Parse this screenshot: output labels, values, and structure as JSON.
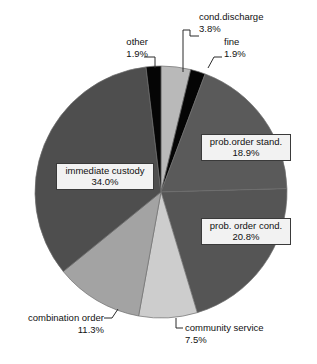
{
  "chart_data": {
    "type": "pie",
    "title": "",
    "subtitle": "",
    "xlabel": "",
    "ylabel": "",
    "legend_position": "none",
    "grid": false,
    "units": "percent",
    "start_angle_deg": 0,
    "direction": "clockwise",
    "categories": [
      "cond.discharge",
      "fine",
      "prob.order stand.",
      "prob. order cond.",
      "community service",
      "combination order",
      "immediate custody",
      "other"
    ],
    "values": [
      3.8,
      1.9,
      18.9,
      20.8,
      7.5,
      11.3,
      34.0,
      1.9
    ],
    "colors": [
      "#b9b9b9",
      "#050505",
      "#5a5a5a",
      "#555555",
      "#cdcdcd",
      "#a3a3a3",
      "#4e4e4e",
      "#050505"
    ],
    "slices": [
      {
        "label": "cond.discharge",
        "value": 3.8,
        "value_text": "3.8%",
        "color": "#b9b9b9",
        "label_style": "callout"
      },
      {
        "label": "fine",
        "value": 1.9,
        "value_text": "1.9%",
        "color": "#050505",
        "label_style": "callout"
      },
      {
        "label": "prob.order stand.",
        "value": 18.9,
        "value_text": "18.9%",
        "color": "#5a5a5a",
        "label_style": "boxed"
      },
      {
        "label": "prob. order cond.",
        "value": 20.8,
        "value_text": "20.8%",
        "color": "#555555",
        "label_style": "boxed"
      },
      {
        "label": "community service",
        "value": 7.5,
        "value_text": "7.5%",
        "color": "#cdcdcd",
        "label_style": "callout"
      },
      {
        "label": "combination order",
        "value": 11.3,
        "value_text": "11.3%",
        "color": "#a3a3a3",
        "label_style": "callout"
      },
      {
        "label": "immediate custody",
        "value": 34.0,
        "value_text": "34.0%",
        "color": "#4e4e4e",
        "label_style": "boxed"
      },
      {
        "label": "other",
        "value": 1.9,
        "value_text": "1.9%",
        "color": "#050505",
        "label_style": "callout"
      }
    ]
  },
  "labels": {
    "cond_discharge": {
      "name": "cond.discharge",
      "pct": "3.8%"
    },
    "fine": {
      "name": "fine",
      "pct": "1.9%"
    },
    "other": {
      "name": "other",
      "pct": "1.9%"
    },
    "prob_order_stand": {
      "name": "prob.order stand.",
      "pct": "18.9%"
    },
    "prob_order_cond": {
      "name": "prob. order cond.",
      "pct": "20.8%"
    },
    "community_service": {
      "name": "community service",
      "pct": "7.5%"
    },
    "combination_order": {
      "name": "combination order",
      "pct": "11.3%"
    },
    "immediate_custody": {
      "name": "immediate custody",
      "pct": "34.0%"
    }
  },
  "colors": {
    "background": "#ffffff",
    "text": "#111111",
    "label_box_fill": "#f2f2f2",
    "label_box_border": "#3a3a3a",
    "leader_line": "#2b2b2b"
  }
}
